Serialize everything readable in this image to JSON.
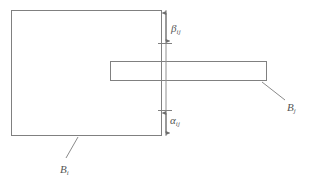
{
  "figure": {
    "kind": "technical-line-diagram",
    "width": 311,
    "height": 183,
    "background_color": "#ffffff",
    "stroke_color": "#808080",
    "text_color": "#555555"
  },
  "shapes": {
    "block_i": {
      "name": "B_i",
      "role": "large-rectangle",
      "x": 11,
      "y": 10,
      "width": 151,
      "height": 126,
      "fill": "none",
      "stroke": "#808080"
    },
    "block_j": {
      "name": "B_j",
      "role": "horizontal-bar-rectangle",
      "x": 110,
      "y": 61,
      "width": 157,
      "height": 20,
      "fill": "none",
      "stroke": "#808080"
    }
  },
  "dimensions": {
    "line_x": 166,
    "beta": {
      "symbol": "β",
      "subscript": "ij",
      "from_y": 11,
      "to_y": 43,
      "tick_y": 43,
      "label_text": "β",
      "label_sub": "ij"
    },
    "alpha": {
      "symbol": "α",
      "subscript": "ij",
      "from_y": 110,
      "to_y": 135,
      "tick_y": 110,
      "label_text": "α",
      "label_sub": "ij"
    }
  },
  "callouts": {
    "bj": {
      "label_text": "B",
      "label_sub": "j",
      "leader_from_x": 262,
      "leader_from_y": 82,
      "leader_to_x": 285,
      "leader_to_y": 100
    },
    "bi": {
      "label_text": "B",
      "label_sub": "i",
      "leader_from_x": 78,
      "leader_from_y": 137,
      "leader_to_x": 66,
      "leader_to_y": 158
    }
  }
}
